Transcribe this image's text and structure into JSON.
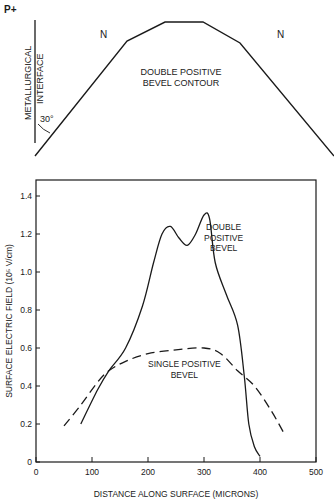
{
  "diagram": {
    "p_label": "P+",
    "n_left": "N",
    "n_right": "N",
    "interface_line1": "METALLURGICAL",
    "interface_line2": "INTERFACE",
    "angle": "30°",
    "contour_line1": "DOUBLE POSITIVE",
    "contour_line2": "BEVEL CONTOUR"
  },
  "chart_data": {
    "type": "line",
    "title": "",
    "xlabel": "DISTANCE ALONG SURFACE (MICRONS)",
    "ylabel": "SURFACE ELECTRIC FIELD (10⁵ V/cm)",
    "xlim": [
      0,
      500
    ],
    "ylim": [
      0,
      1.45
    ],
    "x_ticks": [
      "0",
      "100",
      "200",
      "300",
      "400",
      "500"
    ],
    "y_ticks": [
      "0",
      "0.2",
      "0.4",
      "0.6",
      "0.8",
      "1.0",
      "1.2",
      "1.4"
    ],
    "grid": false,
    "series": [
      {
        "name": "DOUBLE POSITIVE BEVEL",
        "style": "solid",
        "x": [
          80,
          110,
          130,
          160,
          190,
          210,
          225,
          240,
          255,
          270,
          285,
          300,
          310,
          320,
          340,
          360,
          372,
          380,
          390,
          400
        ],
        "y": [
          0.2,
          0.38,
          0.48,
          0.6,
          0.82,
          1.05,
          1.2,
          1.24,
          1.18,
          1.14,
          1.2,
          1.3,
          1.28,
          1.05,
          0.88,
          0.72,
          0.45,
          0.2,
          0.08,
          0.03
        ]
      },
      {
        "name": "SINGLE POSITIVE BEVEL",
        "style": "dashed",
        "x": [
          50,
          80,
          110,
          130,
          160,
          200,
          250,
          300,
          330,
          360,
          390,
          420,
          445
        ],
        "y": [
          0.19,
          0.3,
          0.42,
          0.48,
          0.53,
          0.57,
          0.59,
          0.6,
          0.57,
          0.48,
          0.4,
          0.27,
          0.14
        ]
      }
    ],
    "annotations": [
      {
        "text": [
          "DOUBLE",
          "POSITIVE",
          "BEVEL"
        ],
        "x": 335,
        "y": 1.22
      },
      {
        "text": [
          "SINGLE POSITIVE",
          "BEVEL"
        ],
        "x": 265,
        "y": 0.5
      }
    ]
  }
}
